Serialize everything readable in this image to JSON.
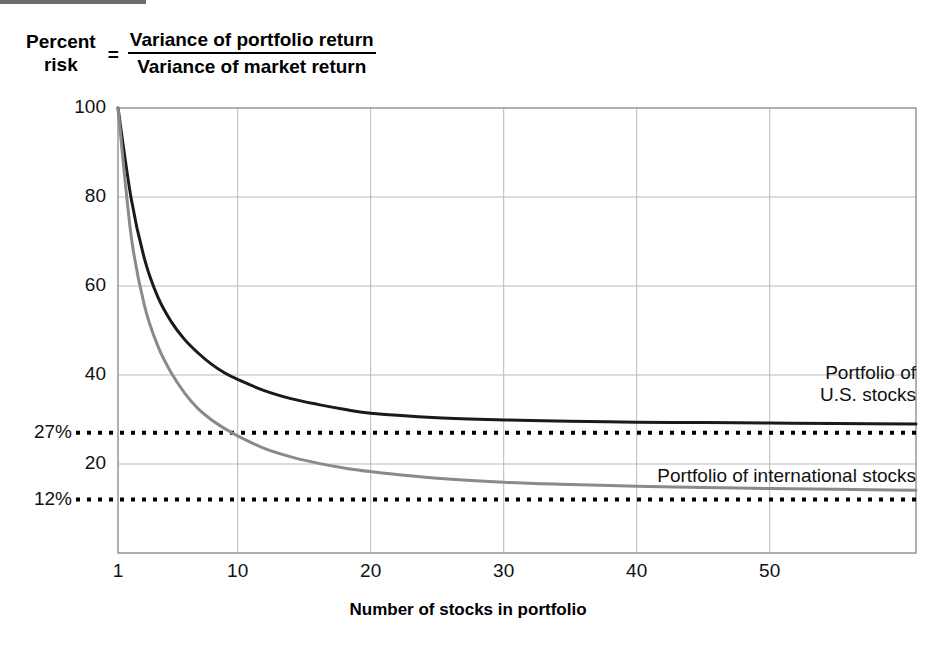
{
  "formula": {
    "lhs_line1": "Percent",
    "lhs_line2": "risk",
    "equals": "=",
    "numerator": "Variance of portfolio return",
    "denominator": "Variance of market return"
  },
  "annotations": {
    "us_line1": "Portfolio of",
    "us_line2": "U.S. stocks",
    "intl": "Portfolio of international stocks"
  },
  "colors": {
    "us_curve": "#1a1a1a",
    "intl_curve": "#8a8a8a",
    "grid": "#b9b9b9",
    "axis": "#8f8f8f",
    "dotted": "#000000",
    "top_bar": "#6d6d6d"
  },
  "chart_data": {
    "type": "line",
    "title": "",
    "xlabel": "Number of stocks in portfolio",
    "ylabel": "Percent risk",
    "xticks": [
      1,
      10,
      20,
      30,
      40,
      50
    ],
    "xtick_labels": [
      "1",
      "10",
      "20",
      "30",
      "40",
      "50"
    ],
    "yticks": [
      20,
      40,
      60,
      80,
      100
    ],
    "ytick_labels": [
      "20",
      "40",
      "60",
      "80",
      "100"
    ],
    "ylim": [
      0,
      100
    ],
    "xlim": [
      1,
      61
    ],
    "grid": true,
    "legend_position": "inline-annotation",
    "reference_lines": [
      {
        "label": "27%",
        "value": 27,
        "style": "dotted",
        "series": "Portfolio of U.S. stocks"
      },
      {
        "label": "12%",
        "value": 12,
        "style": "dotted",
        "series": "Portfolio of international stocks"
      }
    ],
    "series": [
      {
        "name": "Portfolio of U.S. stocks",
        "color": "#1a1a1a",
        "asymptote": 29,
        "x": [
          1,
          2,
          3,
          4,
          5,
          6,
          7,
          8,
          9,
          10,
          12,
          14,
          16,
          18,
          20,
          25,
          30,
          35,
          40,
          45,
          50,
          55,
          61
        ],
        "y": [
          100,
          79.5,
          66.0,
          57.5,
          52.0,
          48.0,
          45.0,
          42.5,
          40.5,
          39.0,
          36.5,
          34.7,
          33.4,
          32.3,
          31.4,
          30.4,
          29.9,
          29.6,
          29.4,
          29.3,
          29.2,
          29.1,
          29.0
        ]
      },
      {
        "name": "Portfolio of international stocks",
        "color": "#8a8a8a",
        "asymptote": 14,
        "x": [
          1,
          2,
          3,
          4,
          5,
          6,
          7,
          8,
          9,
          10,
          12,
          14,
          16,
          18,
          20,
          25,
          30,
          35,
          40,
          45,
          50,
          55,
          61
        ],
        "y": [
          100,
          71.0,
          55.5,
          46.5,
          40.5,
          36.0,
          32.5,
          30.0,
          28.0,
          26.3,
          23.5,
          21.6,
          20.2,
          19.1,
          18.3,
          16.8,
          15.9,
          15.4,
          15.0,
          14.7,
          14.5,
          14.3,
          14.1
        ]
      }
    ]
  }
}
